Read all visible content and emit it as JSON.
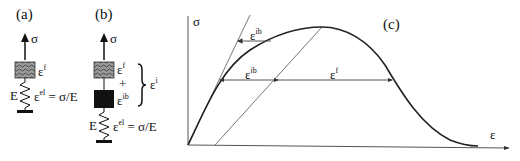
{
  "panels": {
    "a": {
      "label": "(a)",
      "stress_symbol": "σ",
      "friction_element_symbol": "ε",
      "friction_element_sup": "f",
      "spring_symbol": "E",
      "elastic_strain_symbol": "ε",
      "elastic_strain_sup": "el",
      "elastic_strain_eq": " = σ/E"
    },
    "b": {
      "label": "(b)",
      "stress_symbol": "σ",
      "friction_element_symbol": "ε",
      "friction_element_sup": "f",
      "plus": "+",
      "block_element_symbol": "ε",
      "block_element_sup": "ib",
      "brace_symbol": "ε",
      "brace_sup": "i",
      "spring_symbol": "E",
      "elastic_strain_symbol": "ε",
      "elastic_strain_sup": "el",
      "elastic_strain_eq": " = σ/E"
    },
    "c": {
      "label": "(c)",
      "y_axis_label": "σ",
      "x_axis_label": "ε",
      "upper_arrow_label": "ε",
      "upper_arrow_sup": "ib",
      "lower_arrow_label_1": "ε",
      "lower_arrow_sup_1": "ib",
      "lower_arrow_label_2": "ε",
      "lower_arrow_sup_2": "f"
    }
  },
  "colors": {
    "line": "#111111",
    "thin_line": "#555555",
    "hatch_fill": "#8a8a8a",
    "block_fill": "#111111"
  }
}
